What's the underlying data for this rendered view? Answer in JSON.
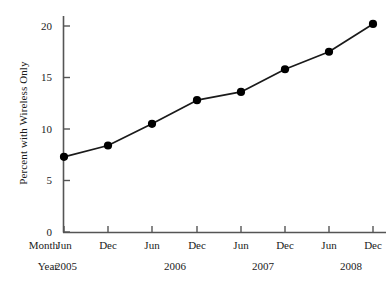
{
  "chart_data": {
    "type": "line",
    "title": "",
    "xlabel": "",
    "ylabel": "Percent with Wireless Only",
    "ylim": [
      0,
      21
    ],
    "yticks": [
      0,
      5,
      10,
      15,
      20
    ],
    "ytick_labels": [
      "0",
      "5",
      "10",
      "15",
      "20"
    ],
    "grid": false,
    "legend": null,
    "row_headers": {
      "month": "Month",
      "year": "Year"
    },
    "categories": [
      "Jun 2005",
      "Dec 2005",
      "Jun 2006",
      "Dec 2006",
      "Jun 2007",
      "Dec 2007",
      "Jun 2008",
      "Dec 2008"
    ],
    "month_labels": [
      "Jun",
      "Dec",
      "Jun",
      "Dec",
      "Jun",
      "Dec",
      "Jun",
      "Dec"
    ],
    "year_labels": [
      "2005",
      "2006",
      "2007",
      "2008"
    ],
    "values": [
      7.3,
      8.4,
      10.5,
      12.8,
      13.6,
      15.8,
      17.5,
      20.2
    ],
    "series": [
      {
        "name": "Percent with Wireless Only",
        "values": [
          7.3,
          8.4,
          10.5,
          12.8,
          13.6,
          15.8,
          17.5,
          20.2
        ]
      }
    ],
    "marker": "filled-circle",
    "colors": {
      "line": "#1a1a1a",
      "marker": "#000000",
      "axis": "#555555",
      "text": "#1a1a1a",
      "background": "#ffffff"
    }
  }
}
